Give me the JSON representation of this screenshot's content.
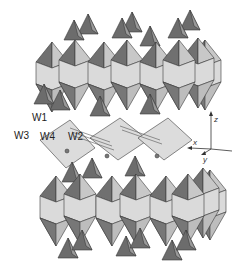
{
  "figure": {
    "type": "polyhedral crystal structure",
    "colors": {
      "light_face": "#d9d9d9",
      "mid_face": "#c4c4c4",
      "dark_face": "#707070",
      "edge": "#3a3a3a",
      "background": "#ffffff"
    },
    "water_labels": [
      "W1",
      "W2",
      "W3",
      "W4"
    ],
    "axes": {
      "x": "x",
      "y": "y",
      "z": "z"
    }
  }
}
